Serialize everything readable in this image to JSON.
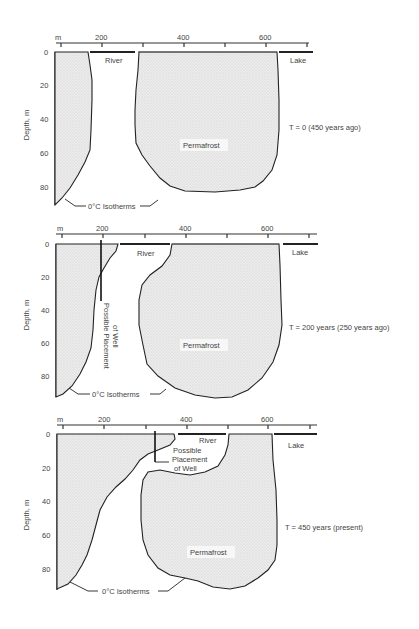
{
  "figure": {
    "x_axis_unit": "m",
    "x_ticks": [
      "200",
      "400",
      "600"
    ],
    "y_axis_label": "Depth, m",
    "y_ticks": [
      "0",
      "20",
      "40",
      "60",
      "80"
    ],
    "isotherm_label": "0°C Isotherms",
    "river_label": "River",
    "lake_label": "Lake",
    "permafrost_label": "Permafrost",
    "well_label_line1": "Possible",
    "well_label_line2": "Placement",
    "well_label_line3": "of Well",
    "well_label_vertical_1": "Possible Placement",
    "well_label_vertical_2": "of Well"
  },
  "panels": [
    {
      "id": "t0",
      "time_label": "T = 0 (450 years ago)"
    },
    {
      "id": "t200",
      "time_label": "T = 200 years (250 years ago)"
    },
    {
      "id": "t450",
      "time_label": "T = 450 years (present)"
    }
  ],
  "colors": {
    "stipple_fill": "#e6e6e6",
    "line": "#222222",
    "text": "#444444"
  }
}
